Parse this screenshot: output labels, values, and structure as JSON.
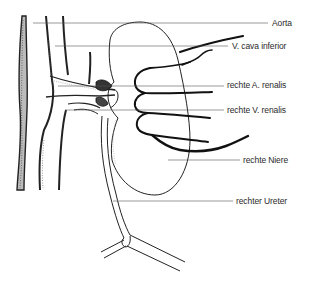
{
  "diagram": {
    "labels": [
      {
        "id": "aorta",
        "text": "Aorta",
        "x": 272,
        "y": 19
      },
      {
        "id": "v-cava-inferior",
        "text": "V. cava inferior",
        "x": 232,
        "y": 42
      },
      {
        "id": "rechte-a-renalis",
        "text": "rechte A. renalis",
        "x": 227,
        "y": 81
      },
      {
        "id": "rechte-v-renalis",
        "text": "rechte V. renalis",
        "x": 227,
        "y": 106
      },
      {
        "id": "rechte-niere",
        "text": "rechte Niere",
        "x": 243,
        "y": 156
      },
      {
        "id": "rechter-ureter",
        "text": "rechter Ureter",
        "x": 236,
        "y": 197
      }
    ],
    "colors": {
      "background": "#ffffff",
      "ink": "#1a1a1a",
      "leader_line": "#555555",
      "text": "#2a2a2a"
    }
  }
}
